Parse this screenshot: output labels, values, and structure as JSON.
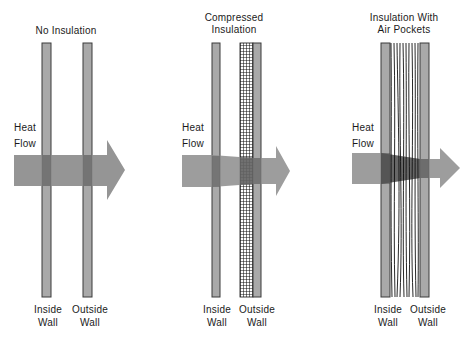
{
  "figure": {
    "panels": [
      {
        "title_lines": [
          "No Insulation"
        ],
        "flow_label_lines": [
          "Heat",
          "Flow"
        ],
        "inside_wall_lines": [
          "Inside",
          "Wall"
        ],
        "outside_wall_lines": [
          "Outside",
          "Wall"
        ],
        "insulation": "none"
      },
      {
        "title_lines": [
          "Compressed",
          "Insulation"
        ],
        "flow_label_lines": [
          "Heat",
          "Flow"
        ],
        "inside_wall_lines": [
          "Inside",
          "Wall"
        ],
        "outside_wall_lines": [
          "Outside",
          "Wall"
        ],
        "insulation": "compressed grid"
      },
      {
        "title_lines": [
          "Insulation With",
          "Air Pockets"
        ],
        "flow_label_lines": [
          "Heat",
          "Flow"
        ],
        "inside_wall_lines": [
          "Inside",
          "Wall"
        ],
        "outside_wall_lines": [
          "Outside",
          "Wall"
        ],
        "insulation": "loose fibers with air pockets"
      }
    ],
    "colors": {
      "wall_fill": "#a9a9a9",
      "wall_edge": "#3a3a3a",
      "arrow_fill": "#8c8c8c",
      "arrow_dark": "#5a5a5a",
      "background": "#ffffff",
      "text": "#1a1a1a"
    }
  }
}
